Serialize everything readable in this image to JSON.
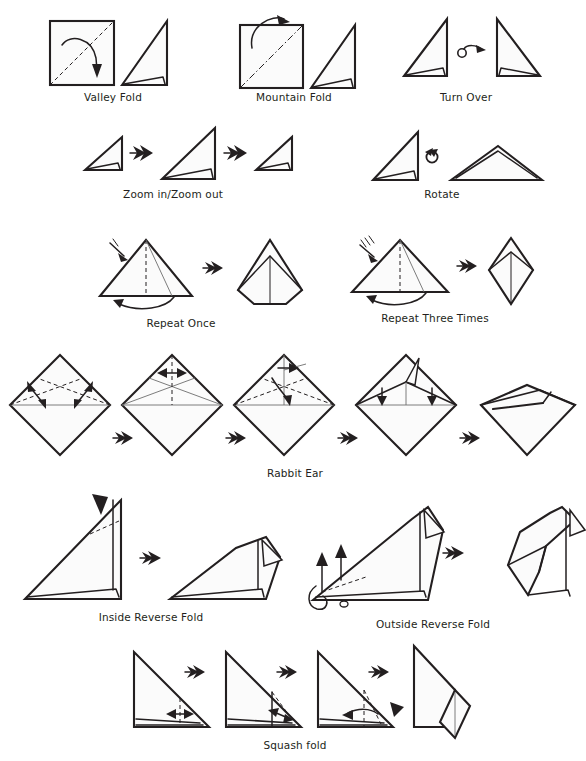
{
  "document": {
    "type": "origami-symbols-reference-chart",
    "background_color": "#ffffff",
    "ink_color": "#231f20",
    "paper_fill": "#fbfbfb",
    "crease_color": "#6d6d6d"
  },
  "captions": {
    "valley_fold": "Valley Fold",
    "mountain_fold": "Mountain Fold",
    "turn_over": "Turn Over",
    "zoom": "Zoom in/Zoom out",
    "rotate": "Rotate",
    "repeat_once": "Repeat Once",
    "repeat_three_times": "Repeat Three Times",
    "rabbit_ear": "Rabbit Ear",
    "inside_reverse_fold": "Inside Reverse Fold",
    "outside_reverse_fold": "Outside Reverse Fold",
    "squash_fold": "Squash fold"
  },
  "rows": [
    {
      "name": "row-1",
      "items": [
        {
          "key": "valley_fold",
          "label": "Valley Fold",
          "steps": 2,
          "line_style": "dashed",
          "arrow": "curved-valley"
        },
        {
          "key": "mountain_fold",
          "label": "Mountain Fold",
          "steps": 2,
          "line_style": "dash-dot",
          "arrow": "curved-mountain"
        },
        {
          "key": "turn_over",
          "label": "Turn Over",
          "steps": 2,
          "arrow": "loop-arrow"
        }
      ]
    },
    {
      "name": "row-2",
      "items": [
        {
          "key": "zoom",
          "label": "Zoom in/Zoom out",
          "steps": 3,
          "arrow": "double-chevron"
        },
        {
          "key": "rotate",
          "label": "Rotate",
          "steps": 2,
          "arrow": "circular-arrow"
        }
      ]
    },
    {
      "name": "row-3",
      "items": [
        {
          "key": "repeat_once",
          "label": "Repeat Once",
          "steps": 2,
          "tick_marks": 1,
          "arrow": "double-chevron"
        },
        {
          "key": "repeat_three_times",
          "label": "Repeat Three Times",
          "steps": 2,
          "tick_marks": 3,
          "arrow": "double-chevron"
        }
      ]
    },
    {
      "name": "row-4",
      "items": [
        {
          "key": "rabbit_ear",
          "label": "Rabbit Ear",
          "steps": 5,
          "arrow": "double-chevron"
        }
      ]
    },
    {
      "name": "row-5",
      "items": [
        {
          "key": "inside_reverse_fold",
          "label": "Inside Reverse Fold",
          "steps": 2,
          "arrow": "double-chevron",
          "push_marker": "solid-wedge"
        },
        {
          "key": "outside_reverse_fold",
          "label": "Outside Reverse Fold",
          "steps": 2,
          "arrow": "double-chevron"
        }
      ]
    },
    {
      "name": "row-6",
      "items": [
        {
          "key": "squash_fold",
          "label": "Squash fold",
          "steps": 4,
          "arrow": "double-chevron",
          "push_marker": "solid-wedge"
        }
      ]
    }
  ],
  "caption_positions": [
    {
      "key": "valley_fold",
      "x": 113,
      "y": 91
    },
    {
      "key": "mountain_fold",
      "x": 294,
      "y": 91
    },
    {
      "key": "turn_over",
      "x": 466,
      "y": 91
    },
    {
      "key": "zoom",
      "x": 173,
      "y": 188
    },
    {
      "key": "rotate",
      "x": 442,
      "y": 188
    },
    {
      "key": "repeat_once",
      "x": 181,
      "y": 316
    },
    {
      "key": "repeat_three_times",
      "x": 435,
      "y": 311
    },
    {
      "key": "rabbit_ear",
      "x": 295,
      "y": 467
    },
    {
      "key": "inside_reverse_fold",
      "x": 151,
      "y": 610
    },
    {
      "key": "outside_reverse_fold",
      "x": 433,
      "y": 617
    },
    {
      "key": "squash_fold",
      "x": 295,
      "y": 739
    }
  ]
}
